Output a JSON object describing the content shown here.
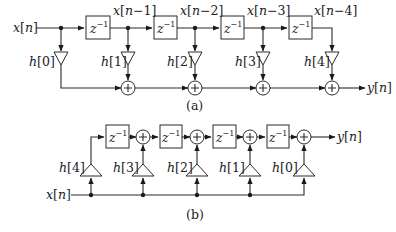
{
  "diagram_a": {
    "caption": "(a)",
    "input_label": "x[n]",
    "output_label": "y[n]",
    "delay_label": "z",
    "delay_exp": "−1",
    "tap_labels": [
      "x[n−1]",
      "x[n−2]",
      "x[n−3]",
      "x[n−4]"
    ],
    "coeff_labels": [
      "h[0]",
      "h[1]",
      "h[2]",
      "h[3]",
      "h[4]"
    ],
    "adder_symbol": "+"
  },
  "diagram_b": {
    "caption": "(b)",
    "input_label": "x[n]",
    "output_label": "y[n]",
    "delay_label": "z",
    "delay_exp": "−1",
    "coeff_labels": [
      "h[4]",
      "h[3]",
      "h[2]",
      "h[1]",
      "h[0]"
    ],
    "adder_symbol": "+"
  },
  "colors": {
    "line": "#2a2a2a",
    "background": "#ffffff"
  }
}
